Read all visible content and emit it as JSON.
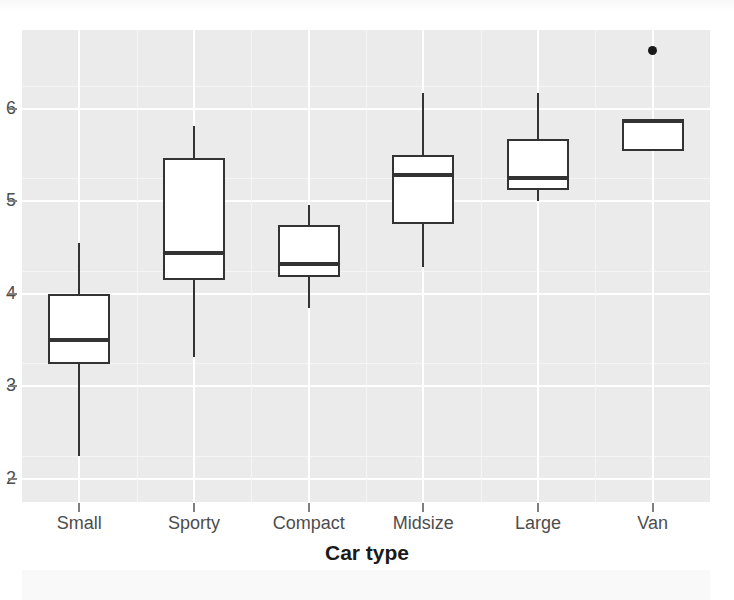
{
  "chart_data": {
    "type": "box",
    "title": "",
    "xlabel": "Car type",
    "ylabel": "Gallons per 100 miles",
    "categories": [
      "Small",
      "Sporty",
      "Compact",
      "Midsize",
      "Large",
      "Van"
    ],
    "ylim": [
      1.75,
      6.85
    ],
    "ytick_labels": [
      "2",
      "3",
      "4",
      "5",
      "6"
    ],
    "ytick_values": [
      2,
      3,
      4,
      5,
      6
    ],
    "grid": "major white gridlines on gray panel, horizontal and vertical",
    "legend": "none",
    "boxes": [
      {
        "category": "Small",
        "whisker_low": 2.25,
        "q1": 3.24,
        "median": 3.5,
        "q3": 4.0,
        "whisker_high": 4.55,
        "outliers": []
      },
      {
        "category": "Sporty",
        "whisker_low": 3.32,
        "q1": 4.15,
        "median": 4.44,
        "q3": 5.47,
        "whisker_high": 5.81,
        "outliers": []
      },
      {
        "category": "Compact",
        "whisker_low": 3.85,
        "q1": 4.18,
        "median": 4.32,
        "q3": 4.74,
        "whisker_high": 4.96,
        "outliers": []
      },
      {
        "category": "Midsize",
        "whisker_low": 4.29,
        "q1": 4.75,
        "median": 5.28,
        "q3": 5.5,
        "whisker_high": 6.17,
        "outliers": []
      },
      {
        "category": "Large",
        "whisker_low": 5.0,
        "q1": 5.12,
        "median": 5.25,
        "q3": 5.67,
        "whisker_high": 6.17,
        "outliers": []
      },
      {
        "category": "Van",
        "whisker_low": 5.54,
        "q1": 5.54,
        "median": 5.87,
        "q3": 5.87,
        "whisker_high": 5.87,
        "outliers": [
          6.63
        ]
      }
    ],
    "colors": {
      "panel_background": "#ebebeb",
      "gridline": "#ffffff",
      "box_fill": "#ffffff",
      "box_stroke": "#333333",
      "median_stroke": "#333333",
      "outlier_fill": "#1a1a1a",
      "axis_text": "#4d4d4d",
      "axis_title": "#1a1a1a",
      "figure_background": "#ffffff"
    }
  }
}
